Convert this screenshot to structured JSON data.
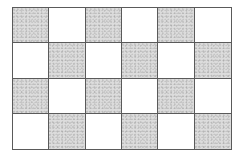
{
  "grid": {
    "rows": 4,
    "cols": 6,
    "pattern": "checkerboard",
    "shaded_color": "#dcdcdc",
    "unshaded_color": "#ffffff",
    "line_color": "#5a5a5a",
    "cells": [
      [
        "shaded",
        "white",
        "shaded",
        "white",
        "shaded",
        "white"
      ],
      [
        "white",
        "shaded",
        "white",
        "shaded",
        "white",
        "shaded"
      ],
      [
        "shaded",
        "white",
        "shaded",
        "white",
        "shaded",
        "white"
      ],
      [
        "white",
        "shaded",
        "white",
        "shaded",
        "white",
        "shaded"
      ]
    ]
  }
}
